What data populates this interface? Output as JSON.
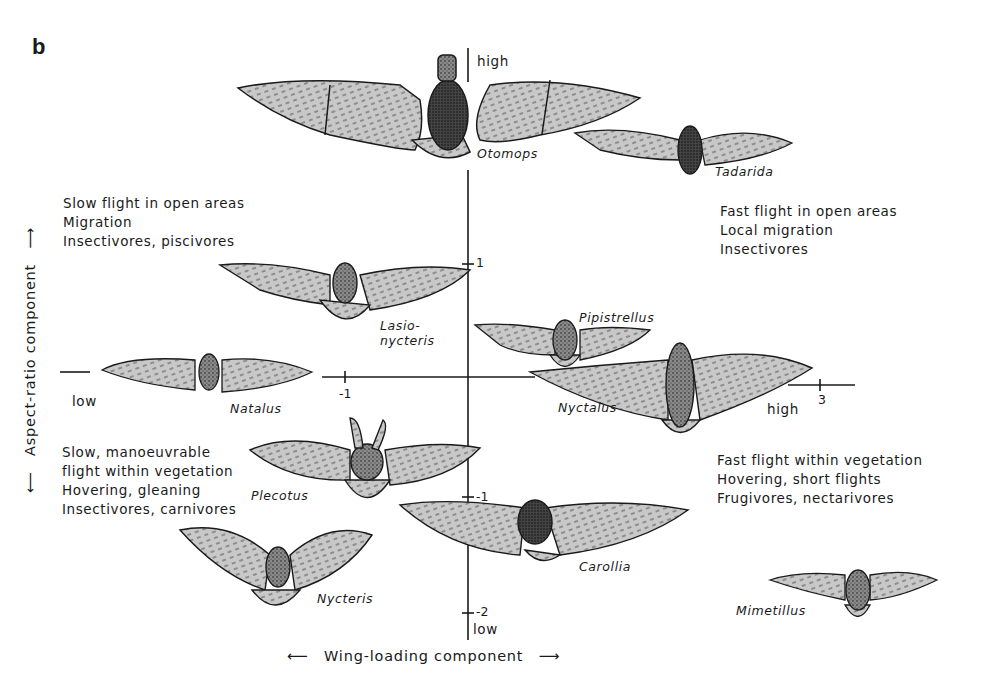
{
  "figure": {
    "panel_letter": "b",
    "x_axis": {
      "title": "Wing-loading component",
      "arrow_left": "⟵",
      "arrow_right": "⟶",
      "low_label": "low",
      "high_label": "high",
      "ticks": [
        "-1",
        "3"
      ]
    },
    "y_axis": {
      "title": "Aspect-ratio component",
      "arrow_up": "⟶",
      "arrow_down": "⟵",
      "high_label": "high",
      "low_label": "low",
      "ticks": [
        "1",
        "-1",
        "-2"
      ]
    },
    "quadrants": {
      "top_left": [
        "Slow flight in open areas",
        "Migration",
        "Insectivores, piscivores"
      ],
      "top_right": [
        "Fast flight in open areas",
        "Local migration",
        "Insectivores"
      ],
      "bottom_left": [
        "Slow, manoeuvrable",
        "flight within vegetation",
        "Hovering, gleaning",
        "Insectivores, carnivores"
      ],
      "bottom_right": [
        "Fast flight within vegetation",
        "Hovering, short flights",
        "Frugivores, nectarivores"
      ]
    },
    "bats": [
      {
        "name": "Otomops"
      },
      {
        "name": "Tadarida"
      },
      {
        "name": "Lasio-"
      },
      {
        "name": "nycteris"
      },
      {
        "name": "Pipistrellus"
      },
      {
        "name": "Natalus"
      },
      {
        "name": "Nyctalus"
      },
      {
        "name": "Plecotus"
      },
      {
        "name": "Carollia"
      },
      {
        "name": "Nycteris"
      },
      {
        "name": "Mimetillus"
      }
    ],
    "colors": {
      "ink": "#1a1a1a",
      "wing_fill": "#c8c8c8",
      "body_fill": "#6a6a6a",
      "background": "#ffffff"
    }
  }
}
